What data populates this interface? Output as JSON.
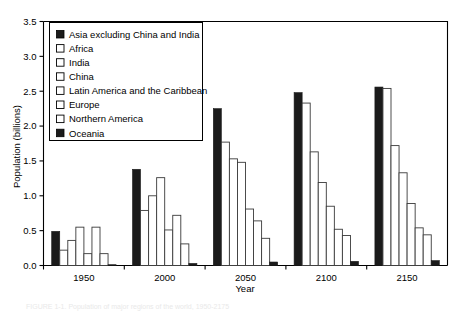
{
  "figure": {
    "caption": "FIGURE 1-1. Population of major regions of the world, 1950-2175"
  },
  "chart_data": {
    "type": "bar",
    "title": "",
    "xlabel": "Year",
    "ylabel": "Population (billions)",
    "ylim": [
      0.0,
      3.5
    ],
    "yticks": [
      0.0,
      0.5,
      1.0,
      1.5,
      2.0,
      2.5,
      3.0,
      3.5
    ],
    "ytick_labels": [
      "0.0",
      "0.5",
      "1.0",
      "1.5",
      "2.0",
      "2.5",
      "3.0",
      "3.5"
    ],
    "xticks": [
      1950,
      2000,
      2050,
      2100,
      2150
    ],
    "xtick_labels": [
      "1950",
      "2000",
      "2050",
      "2100",
      "2150"
    ],
    "grid": false,
    "legend_position": "upper-left-inside",
    "categories": [
      "1950",
      "2000",
      "2050",
      "2100",
      "2150"
    ],
    "series": [
      {
        "name": "Asia excluding China and India",
        "swatch": "dark",
        "values": [
          0.49,
          1.38,
          2.25,
          2.48,
          2.56
        ]
      },
      {
        "name": "Africa",
        "swatch": "light",
        "values": [
          0.22,
          0.79,
          1.77,
          2.33,
          2.54
        ]
      },
      {
        "name": "India",
        "swatch": "light",
        "values": [
          0.36,
          1.0,
          1.53,
          1.63,
          1.72
        ]
      },
      {
        "name": "China",
        "swatch": "light",
        "values": [
          0.55,
          1.26,
          1.48,
          1.19,
          1.33
        ]
      },
      {
        "name": "Latin America and the Caribbean",
        "swatch": "light",
        "values": [
          0.17,
          0.51,
          0.81,
          0.85,
          0.89
        ]
      },
      {
        "name": "Europe",
        "swatch": "light",
        "values": [
          0.55,
          0.72,
          0.64,
          0.52,
          0.54
        ]
      },
      {
        "name": "Northern America",
        "swatch": "light",
        "values": [
          0.17,
          0.31,
          0.39,
          0.43,
          0.44
        ]
      },
      {
        "name": "Oceania",
        "swatch": "dark",
        "values": [
          0.01,
          0.03,
          0.05,
          0.06,
          0.07
        ]
      }
    ]
  },
  "legend": {
    "items": [
      {
        "label": "Asia excluding China and India",
        "swatch": "dark"
      },
      {
        "label": "Africa",
        "swatch": "light"
      },
      {
        "label": "India",
        "swatch": "light"
      },
      {
        "label": "China",
        "swatch": "light"
      },
      {
        "label": "Latin America and the Caribbean",
        "swatch": "light"
      },
      {
        "label": "Europe",
        "swatch": "light"
      },
      {
        "label": "Northern America",
        "swatch": "light"
      },
      {
        "label": "Oceania",
        "swatch": "dark"
      }
    ]
  },
  "colors": {
    "dark": "#1b1b1b",
    "light": "#ffffff",
    "outline": "#000000",
    "background": "#ffffff"
  }
}
